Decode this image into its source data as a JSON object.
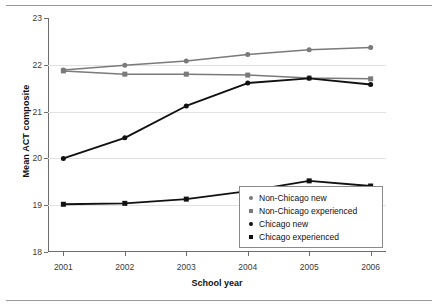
{
  "chart_data": {
    "type": "line",
    "title": "",
    "xlabel": "School year",
    "ylabel": "Mean ACT composite",
    "categories": [
      "2001",
      "2002",
      "2003",
      "2004",
      "2005",
      "2006"
    ],
    "x": [
      2001,
      2002,
      2003,
      2004,
      2005,
      2006
    ],
    "xlim": [
      2000.75,
      2006.25
    ],
    "ylim": [
      18,
      23
    ],
    "yticks": [
      "18",
      "19",
      "20",
      "21",
      "22",
      "23"
    ],
    "grid": true,
    "legend_position": "lower right",
    "series": [
      {
        "name": "Non-Chicago new",
        "marker": "circle",
        "color": "#7a7a7a",
        "values": [
          21.89,
          21.99,
          22.08,
          22.22,
          22.32,
          22.37
        ]
      },
      {
        "name": "Non-Chicago experienced",
        "marker": "square",
        "color": "#7a7a7a",
        "values": [
          21.87,
          21.8,
          21.8,
          21.78,
          21.72,
          21.7
        ]
      },
      {
        "name": "Chicago new",
        "marker": "circle",
        "color": "#111111",
        "values": [
          20.0,
          20.44,
          21.12,
          21.61,
          21.71,
          21.58
        ]
      },
      {
        "name": "Chicago experienced",
        "marker": "square",
        "color": "#111111",
        "values": [
          19.02,
          19.04,
          19.13,
          19.3,
          19.52,
          19.41
        ]
      }
    ]
  },
  "axes": {
    "y_title": "Mean ACT composite",
    "x_title": "School year"
  },
  "legend": {
    "entries": [
      {
        "label": "Non-Chicago new",
        "marker": "circle",
        "color": "#7a7a7a"
      },
      {
        "label": "Non-Chicago experienced",
        "marker": "square",
        "color": "#7a7a7a"
      },
      {
        "label": "Chicago new",
        "marker": "circle",
        "color": "#111111"
      },
      {
        "label": "Chicago experienced",
        "marker": "square",
        "color": "#111111"
      }
    ]
  }
}
